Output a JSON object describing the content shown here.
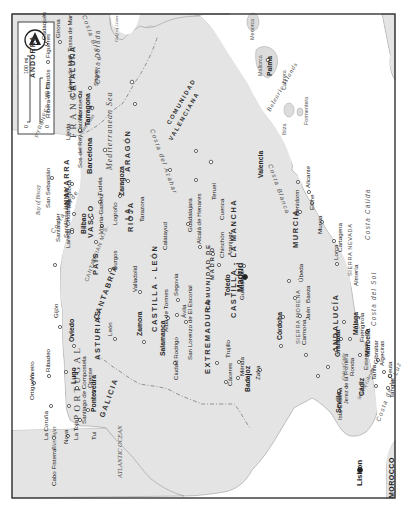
{
  "map": {
    "orientation": "rotated 90deg clockwise (north points right)",
    "legend": {
      "scale_mi_label": "100 mi",
      "scale_km_label": "100 km",
      "zero_label": "0",
      "north_arrow": "north-arrow-icon"
    },
    "countries": [
      "FRANCE",
      "PORTUGAL",
      "MOROCCO",
      "ANDORRA"
    ],
    "water_bodies": {
      "atlantic": "ATLANTIC OCEAN",
      "mediterranean": "Mediterranean Sea",
      "biscay": "Bay of Biscay",
      "gulf_lions": "Gulf of Lions",
      "gulf_cadiz": "Gulf of Cádiz",
      "strait": "Strait of Gibraltar",
      "rias_altas": "Rías Altas",
      "rias_bajas": "Rías Bajas",
      "balearic": "Balearic Islands"
    },
    "coasts": {
      "costa_verde": "Costa Verde",
      "costa_brava": "Costa Brava",
      "costa_dorada": "Costa Dorada",
      "costa_azahar": "Costa del Azahar",
      "costa_blanca": "Costa Blanca",
      "costa_calida": "Costa Cálida",
      "costa_sol": "Costa del Sol",
      "costa_luz": "Costa de la Luz"
    },
    "mountains": {
      "pyrenees": "PYRENEES",
      "cantabrian": "CANTABRIAN MTS.",
      "sierra_morena": "SIERRA MORENA",
      "sierra_nevada": "SIERRA NEVADA"
    },
    "regions": {
      "galicia": "GALICIA",
      "asturias": "ASTURIAS",
      "cantabria": "CANTABRIA",
      "pais_vasco_1": "PAÍS",
      "pais_vasco_2": "VASCO",
      "navarra": "NAVARRA",
      "la_rioja_1": "LA",
      "la_rioja_2": "RIOJA",
      "aragon": "ARAGÓN",
      "cataluna": "CATALUÑA",
      "castilla_leon": "CASTILLA - LEÓN",
      "madrid_1": "COMUNIDAD DE",
      "madrid_2": "MADRID",
      "extremadura": "EXTREMADURA",
      "castilla_mancha": "CASTILLA - LA MANCHA",
      "valenciana_1": "COMUNIDAD",
      "valenciana_2": "VALENCIANA",
      "murcia": "MURCIA",
      "andalucia": "ANDALUCÍA"
    },
    "islands": {
      "menorca": "Menorca",
      "mallorca": "Mallorca",
      "cabrera": "Cabrera",
      "ibiza": "Ibiza",
      "formentera": "Formentera"
    },
    "cities": {
      "madrid": "Madrid",
      "lisbon": "Lisbon",
      "barcelona": "Barcelona",
      "valencia": "Valencia",
      "bilbao": "Bilbao",
      "zaragoza": "Zaragoza",
      "tarragona": "Tarragona",
      "sevilla": "Seville",
      "granada": "Granada",
      "palma": "Palma",
      "cadaques": "Cadaqués",
      "girona": "Girona",
      "tossa": "Tossa de Mar",
      "figueres": "Figueres",
      "lloret": "Lloret de Mar",
      "montserrat": "Montserrat",
      "sitges": "Sitges",
      "ribera": "Ribera de Cardós",
      "lleida": "Lleida",
      "sos": "Sos del Rey Católico",
      "pamplona": "Pamplona",
      "tudela": "Tudela",
      "san_sebastian": "San Sebastián",
      "ondarroa": "Ondárroa",
      "laredo": "Laredo",
      "vitoria": "Vitoria-Gasteiz",
      "logrono": "Logroño",
      "tarazona": "Tarazona",
      "calatayud": "Calatayud",
      "teruel": "Teruel",
      "cuenca": "Cuenca",
      "guadalajara": "Guadalajara",
      "alcala": "Alcalá de Henares",
      "chinchon": "Chinchón",
      "aranjuez": "Aranjuez",
      "toledo": "Toledo",
      "guadalupe": "Guadalupe",
      "santander": "Santander",
      "santillana": "Santillana del Mar",
      "burgos": "Burgos",
      "valladolid": "Valladolid",
      "segovia": "Segovia",
      "avila": "Ávila",
      "escorial": "San Lorenzo de El Escorial",
      "alba": "Alba de Tormes",
      "salamanca": "Salamanca",
      "zamora": "Zamora",
      "ciudad_rodrigo": "Ciudad Rodrigo",
      "leon": "León",
      "gijon": "Gijón",
      "oviedo": "Oviedo",
      "ribadeo": "Ribadeo",
      "viveiro": "Viveiro",
      "ortigueira": "Ortigueira",
      "lugo": "Lugo",
      "la_coruna": "La Coruña",
      "santiago": "Santiago de Compostela",
      "pontevedra": "Pontevedra",
      "orense": "Orense",
      "noya": "Noya",
      "la_toja": "La Toja",
      "tui": "Tui",
      "finisterre": "Cabo Fisterra",
      "trujillo": "Trujillo",
      "caceres": "Cáceres",
      "merida": "Mérida",
      "badajoz": "Badajoz",
      "zafra": "Zafra",
      "cordoba": "Córdoba",
      "carmona": "Carmona",
      "jaen": "Jaén",
      "baeza": "Baeza",
      "ubeda": "Úbeda",
      "isla_cristina": "Isla Cristina",
      "jerez": "Jerez de la Frontera",
      "cadiz": "Cádiz",
      "ronda": "Ronda",
      "estepona": "Estepona",
      "marbella": "Marbella",
      "malaga": "Málaga",
      "fuengirola": "Fuengirola",
      "tarifa": "Tarifa",
      "gibraltar": "Gibraltar",
      "algeciras": "Algeciras",
      "ceuta": "Ceuta",
      "tangier": "Tangier",
      "almeria": "Almería",
      "lorca": "Lorca",
      "murcia": "Murcia",
      "cartagena": "Cartagena",
      "elche": "Elche",
      "alicante": "Alicante",
      "benidorm": "Benidorm"
    }
  }
}
